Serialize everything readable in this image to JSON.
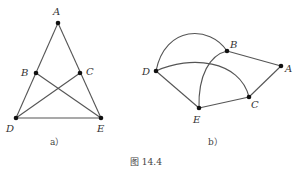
{
  "figure": {
    "caption": "图 14.4",
    "subfigures": [
      {
        "id": "a",
        "label": "a）",
        "points": {
          "A": "A",
          "B": "B",
          "C": "C",
          "D": "D",
          "E": "E"
        },
        "edges": [
          "A-D",
          "A-E",
          "D-E",
          "B-E",
          "C-D"
        ]
      },
      {
        "id": "b",
        "label": "b）",
        "points": {
          "A": "A",
          "B": "B",
          "C": "C",
          "D": "D",
          "E": "E"
        },
        "edges": [
          "B-A",
          "A-C",
          "C-E",
          "E-D",
          "D-B (arc)",
          "D-C (arc)",
          "E-B (arc)"
        ]
      }
    ]
  }
}
